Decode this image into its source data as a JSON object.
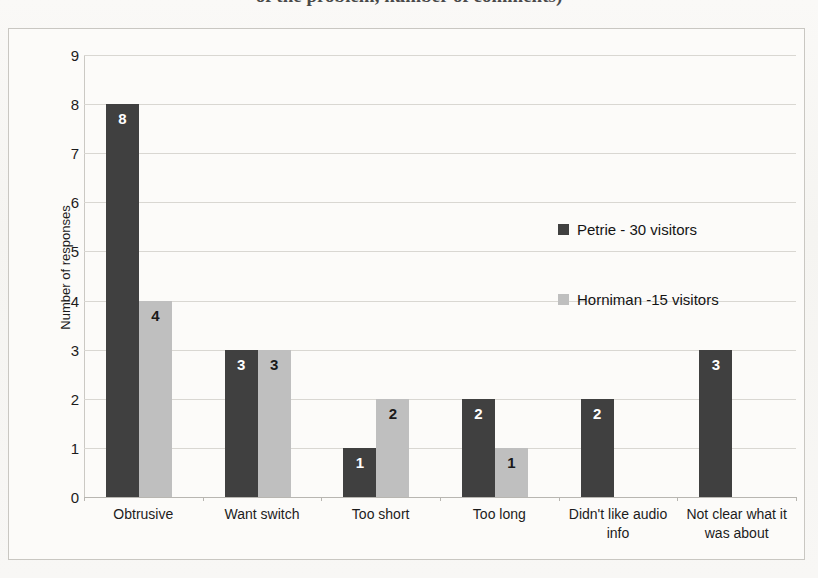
{
  "title_partial": "of the problem, number of comments)",
  "chart_data": {
    "type": "bar",
    "title": "",
    "xlabel": "",
    "ylabel": "Number of responses",
    "ylim": [
      0,
      9
    ],
    "yticks": [
      "0",
      "1",
      "2",
      "3",
      "4",
      "5",
      "6",
      "7",
      "8",
      "9"
    ],
    "grid": true,
    "legend_position": "inside-right",
    "categories": [
      "Obtrusive",
      "Want switch",
      "Too short",
      "Too long",
      "Didn't like audio info",
      "Not clear what it was about"
    ],
    "series": [
      {
        "name": "Petrie - 30 visitors",
        "color": "#404040",
        "label_color": "#ffffff",
        "values": [
          8,
          3,
          1,
          2,
          2,
          3
        ],
        "labels": [
          "8",
          "3",
          "1",
          "2",
          "2",
          "3"
        ]
      },
      {
        "name": "Horniman -15 visitors",
        "color": "#bfbfbf",
        "label_color": "#1a1a1a",
        "values": [
          4,
          3,
          2,
          1,
          0,
          0
        ],
        "labels": [
          "4",
          "3",
          "2",
          "1",
          "",
          ""
        ]
      }
    ]
  }
}
